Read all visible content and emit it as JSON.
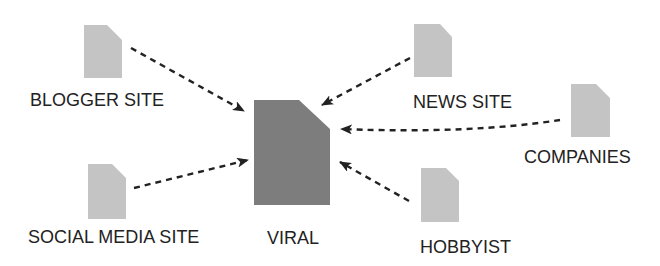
{
  "colors": {
    "source_doc": "#c4c4c4",
    "center_doc": "#7d7d7d",
    "arrow": "#222222",
    "text": "#222222",
    "background": "#ffffff"
  },
  "center": {
    "label": "VIRAL",
    "icon": "document-icon"
  },
  "sources": [
    {
      "id": "blogger",
      "label": "BLOGGER SITE",
      "icon": "document-icon"
    },
    {
      "id": "news",
      "label": "NEWS SITE",
      "icon": "document-icon"
    },
    {
      "id": "companies",
      "label": "COMPANIES",
      "icon": "document-icon"
    },
    {
      "id": "social",
      "label": "SOCIAL MEDIA SITE",
      "icon": "document-icon"
    },
    {
      "id": "hobbyist",
      "label": "HOBBYIST",
      "icon": "document-icon"
    }
  ],
  "edges": [
    {
      "from": "blogger",
      "to": "center",
      "style": "dashed-arrow"
    },
    {
      "from": "news",
      "to": "center",
      "style": "dashed-arrow"
    },
    {
      "from": "companies",
      "to": "center",
      "style": "dashed-arrow"
    },
    {
      "from": "social",
      "to": "center",
      "style": "dashed-arrow"
    },
    {
      "from": "hobbyist",
      "to": "center",
      "style": "dashed-arrow"
    }
  ]
}
